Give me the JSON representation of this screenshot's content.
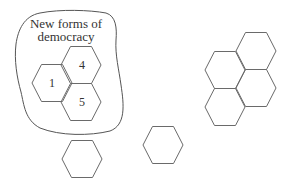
{
  "diagram": {
    "group": {
      "title_line1": "New forms of",
      "title_line2": "democracy",
      "hexagons": [
        {
          "label": "1",
          "cx": 52,
          "cy": 83
        },
        {
          "label": "4",
          "cx": 81,
          "cy": 65
        },
        {
          "label": "5",
          "cx": 81,
          "cy": 102
        }
      ]
    },
    "cluster_hexagons": [
      {
        "cx": 256,
        "cy": 51
      },
      {
        "cx": 225,
        "cy": 70
      },
      {
        "cx": 256,
        "cy": 88
      },
      {
        "cx": 225,
        "cy": 107
      }
    ],
    "loose_hexagons": [
      {
        "cx": 82,
        "cy": 159
      },
      {
        "cx": 163,
        "cy": 145
      }
    ],
    "colors": {
      "stroke": "#6a6a6a",
      "text": "#333333",
      "background": "#ffffff"
    }
  }
}
